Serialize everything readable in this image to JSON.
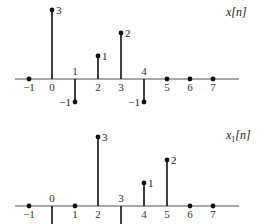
{
  "chart_data": [
    {
      "type": "stem",
      "title": "x[n]",
      "title_main": "x",
      "title_sub": "",
      "title_arg": "[n]",
      "x": [
        -1,
        0,
        1,
        2,
        3,
        4,
        5,
        6,
        7
      ],
      "values": [
        0,
        3,
        -1,
        1,
        2,
        -1,
        0,
        0,
        0
      ],
      "value_labels": [
        "",
        "3",
        "−1",
        "1",
        "2",
        "−1",
        "",
        "",
        ""
      ],
      "tick_labels": [
        "−1",
        "0",
        "1",
        "2",
        "3",
        "4",
        "5",
        "6",
        "7"
      ],
      "xlabel": "",
      "ylabel": "",
      "grid": false
    },
    {
      "type": "stem",
      "title": "x1[n]",
      "title_main": "x",
      "title_sub": "1",
      "title_arg": "[n]",
      "x": [
        -1,
        0,
        1,
        2,
        3,
        4,
        5,
        6,
        7
      ],
      "values": [
        0,
        -1,
        0,
        3,
        -1,
        1,
        2,
        0,
        0
      ],
      "value_labels": [
        "",
        "",
        "",
        "3",
        "",
        "1",
        "2",
        "",
        ""
      ],
      "tick_labels": [
        "−1",
        "0",
        "1",
        "2",
        "3",
        "4",
        "5",
        "6",
        "7"
      ],
      "xlabel": "",
      "ylabel": "",
      "grid": false,
      "note": "negative samples at n=0 and n=3 extend below the visible frame"
    }
  ]
}
